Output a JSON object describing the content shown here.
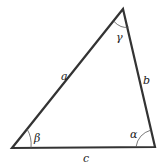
{
  "diagram": {
    "type": "triangle",
    "vertices": {
      "top": [
        123,
        9
      ],
      "bottom_left": [
        12,
        148
      ],
      "bottom_right": [
        155,
        147
      ]
    },
    "sides": {
      "a": "a",
      "b": "b",
      "c": "c"
    },
    "angles": {
      "alpha": "α",
      "beta": "β",
      "gamma": "γ"
    },
    "colors": {
      "stroke": "#333333",
      "arc": "#555555",
      "label": "#222222"
    }
  }
}
